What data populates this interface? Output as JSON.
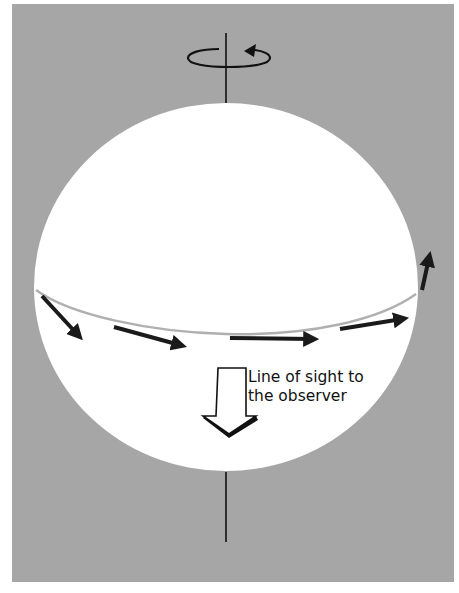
{
  "figure": {
    "colors": {
      "background": "#a6a6a6",
      "sphere": "#ffffff",
      "equator": "#b0b0b0",
      "arrows": "#1a1a1a"
    },
    "rotation_axis": {
      "icon": "rotation-arrow-icon",
      "direction": "counterclockwise"
    },
    "velocity_arrows_count": 5,
    "line_of_sight": {
      "icon": "down-arrow-icon",
      "label_line1": "Line of sight to",
      "label_line2": "the observer"
    }
  }
}
